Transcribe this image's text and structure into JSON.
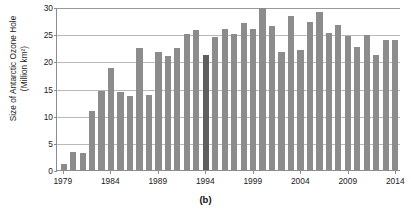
{
  "figure": {
    "caption": "(b)",
    "ytitle_line1": "Size of Antarctic Ozone Hole",
    "ytitle_line2": "(Million km²)"
  },
  "colors": {
    "bar": "#8c8c8c",
    "bar_highlight": "#5f5f5f",
    "grid": "#b9b9b9",
    "axis": "#8d8d8d",
    "text": "#1a1a1a",
    "background": "#ffffff"
  },
  "chart_data": {
    "type": "bar",
    "title": "(b)",
    "xlabel": "",
    "ylabel": "Size of Antarctic Ozone Hole (Million km²)",
    "ylim": [
      0,
      30
    ],
    "yticks": [
      0,
      5,
      10,
      15,
      20,
      25,
      30
    ],
    "ytick_labels": [
      "0",
      "5",
      "10",
      "15",
      "20",
      "25",
      "30"
    ],
    "xlim": [
      1979,
      2014
    ],
    "xticks": [
      1979,
      1984,
      1989,
      1994,
      1999,
      2004,
      2009,
      2014
    ],
    "xtick_labels": [
      "1979",
      "1984",
      "1989",
      "1994",
      "1999",
      "2004",
      "2009",
      "2014"
    ],
    "grid": true,
    "legend": null,
    "highlight": {
      "category": "1994",
      "color": "#5f5f5f",
      "note": "1994 bar drawn in darker grey"
    },
    "categories": [
      "1979",
      "1980",
      "1981",
      "1982",
      "1983",
      "1984",
      "1985",
      "1986",
      "1987",
      "1988",
      "1989",
      "1990",
      "1991",
      "1992",
      "1993",
      "1994",
      "1995",
      "1996",
      "1997",
      "1998",
      "1999",
      "2000",
      "2001",
      "2002",
      "2003",
      "2004",
      "2005",
      "2006",
      "2007",
      "2008",
      "2009",
      "2010",
      "2011",
      "2012",
      "2013",
      "2014"
    ],
    "values": [
      1.1,
      3.3,
      3.1,
      10.8,
      14.6,
      18.8,
      14.3,
      13.6,
      22.4,
      13.8,
      21.7,
      21.0,
      22.4,
      25.0,
      25.8,
      21.1,
      24.5,
      25.9,
      25.1,
      27.0,
      25.9,
      29.9,
      26.5,
      21.7,
      28.4,
      22.0,
      27.2,
      29.0,
      25.3,
      26.7,
      24.7,
      22.6,
      24.9,
      21.1,
      24.0,
      23.9
    ]
  }
}
